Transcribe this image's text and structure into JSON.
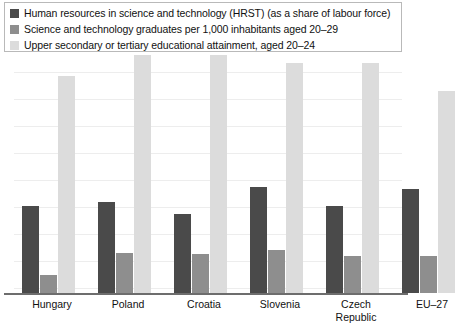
{
  "chart_data": {
    "type": "bar",
    "title": "",
    "subtitle": "",
    "xlabel": "",
    "ylabel": "",
    "grid": true,
    "legend_position": "top",
    "ylim": [
      0,
      100
    ],
    "categories": [
      "Hungary",
      "Poland",
      "Croatia",
      "Slovenia",
      "Czech Republic",
      "EU-27"
    ],
    "category_lines": [
      [
        "Hungary"
      ],
      [
        "Poland"
      ],
      [
        "Croatia"
      ],
      [
        "Slovenia"
      ],
      [
        "Czech",
        "Republic"
      ],
      [
        "EU–27"
      ]
    ],
    "series": [
      {
        "name": "Human resources in science and technology (HRST) (as a share of labour force)",
        "color": "#4a4a4a",
        "values": [
          36.6,
          38.3,
          33.0,
          44.5,
          36.6,
          43.6
        ]
      },
      {
        "name": "Science and technology graduates per 1,000 inhabitants aged 20–29",
        "color": "#8e8e8e",
        "values": [
          7.5,
          16.7,
          16.3,
          18.1,
          15.4,
          15.4
        ]
      },
      {
        "name": "Upper secondary or tertiary educational attainment, aged 20–24",
        "color": "#dcdcdc",
        "values": [
          91.2,
          100.0,
          100.0,
          96.5,
          96.5,
          85.0
        ]
      }
    ],
    "gridline_count": 9
  },
  "legend": {
    "items": [
      {
        "swatch": "legend-swatch-dark",
        "color": "#4a4a4a",
        "label": "Human resources in science and technology (HRST) (as a share of labour force)"
      },
      {
        "swatch": "legend-swatch-medium",
        "color": "#8e8e8e",
        "label": "Science and technology graduates per 1,000 inhabitants aged 20–29"
      },
      {
        "swatch": "legend-swatch-light",
        "color": "#dcdcdc",
        "label": "Upper secondary or tertiary educational attainment, aged 20–24"
      }
    ]
  }
}
